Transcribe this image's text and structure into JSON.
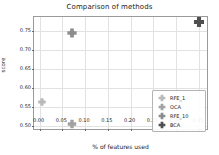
{
  "chart_data": {
    "type": "scatter",
    "title": "Comparison of methods",
    "xlabel": "% of features used",
    "ylabel": "score",
    "xlim": [
      -0.0125,
      0.3725
    ],
    "ylim": [
      0.4875,
      0.7875
    ],
    "grid": true,
    "legend_position": "lower right",
    "xticks": [
      "0.00",
      "0.05",
      "0.10",
      "0.15",
      "0.20",
      "0.25",
      "0.30",
      "0.35"
    ],
    "xtick_values": [
      0.0,
      0.05,
      0.1,
      0.15,
      0.2,
      0.25,
      0.3,
      0.35
    ],
    "yticks": [
      "0.50",
      "0.55",
      "0.60",
      "0.65",
      "0.70",
      "0.75"
    ],
    "ytick_values": [
      0.5,
      0.55,
      0.6,
      0.65,
      0.7,
      0.75
    ],
    "series": [
      {
        "name": "RFE_1",
        "marker": "plus-filled",
        "color": "#b9b9b9",
        "size": 9,
        "x": [
          0.005
        ],
        "y": [
          0.563
        ],
        "values": [
          [
            0.005,
            0.563
          ]
        ]
      },
      {
        "name": "OCA",
        "marker": "plus-filled",
        "color": "#a2a2a2",
        "size": 10,
        "x": [
          0.07
        ],
        "y": [
          0.507
        ],
        "values": [
          [
            0.07,
            0.507
          ]
        ]
      },
      {
        "name": "RFE_10",
        "marker": "plus-filled",
        "color": "#8c8c8c",
        "size": 11,
        "x": [
          0.07
        ],
        "y": [
          0.745
        ],
        "values": [
          [
            0.07,
            0.745
          ]
        ]
      },
      {
        "name": "BCA",
        "marker": "plus-filled",
        "color": "#4f4f4f",
        "size": 12,
        "x": [
          0.35
        ],
        "y": [
          0.775
        ],
        "values": [
          [
            0.35,
            0.775
          ]
        ]
      }
    ]
  },
  "colors": {
    "axis": "#9a9a9a",
    "grid": "#e2e2e2",
    "text": "#1a1a1a",
    "legend_border": "#b4b4b4",
    "background": "#ffffff"
  }
}
